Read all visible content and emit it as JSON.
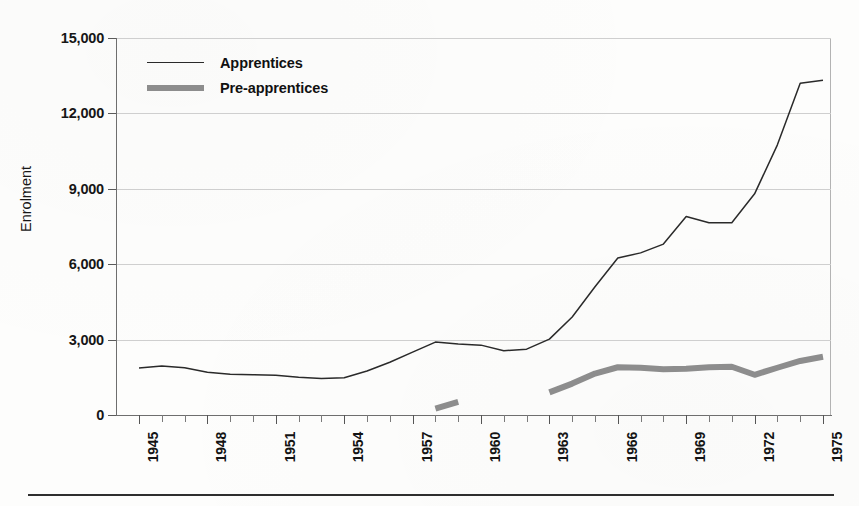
{
  "figure": {
    "ylabel": "Enrolment",
    "legend": [
      {
        "label": "Apprentices",
        "style": "thin-black-line",
        "color": "#2a2a2a"
      },
      {
        "label": "Pre-apprentices",
        "style": "thick-gray-line",
        "color": "#8d8d8d"
      }
    ]
  },
  "axes": {
    "y_ticks": [
      "0",
      "3,000",
      "6,000",
      "9,000",
      "12,000",
      "15,000"
    ],
    "x_ticks": [
      "1945",
      "1948",
      "1951",
      "1954",
      "1957",
      "1960",
      "1963",
      "1966",
      "1969",
      "1972",
      "1975"
    ]
  },
  "chart_data": {
    "type": "line",
    "title": "",
    "xlabel": "",
    "ylabel": "Enrolment",
    "xlim": [
      1945,
      1975
    ],
    "ylim": [
      0,
      15000
    ],
    "yticks": [
      0,
      3000,
      6000,
      9000,
      12000,
      15000
    ],
    "xticks": [
      1945,
      1948,
      1951,
      1954,
      1957,
      1960,
      1963,
      1966,
      1969,
      1972,
      1975
    ],
    "xtick_rotation": 90,
    "grid": "horizontal",
    "legend_position": "upper-left-inside",
    "x": [
      1945,
      1946,
      1947,
      1948,
      1949,
      1950,
      1951,
      1952,
      1953,
      1954,
      1955,
      1956,
      1957,
      1958,
      1959,
      1960,
      1961,
      1962,
      1963,
      1964,
      1965,
      1966,
      1967,
      1968,
      1969,
      1970,
      1971,
      1972,
      1973,
      1974,
      1975
    ],
    "series": [
      {
        "name": "Apprentices",
        "color": "#2a2a2a",
        "line_width": 1.5,
        "values": [
          1870,
          1950,
          1880,
          1700,
          1620,
          1600,
          1580,
          1500,
          1450,
          1480,
          1750,
          2100,
          2500,
          2900,
          2820,
          2780,
          2560,
          2620,
          3020,
          3900,
          5100,
          6250,
          6450,
          6800,
          7900,
          7650,
          7650,
          8800,
          10750,
          13200,
          13320
        ]
      },
      {
        "name": "Pre-apprentices",
        "color": "#8d8d8d",
        "line_width": 6,
        "segments": [
          {
            "x": [
              1958,
              1959
            ],
            "values": [
              250,
              520
            ]
          },
          {
            "x": [
              1963,
              1964,
              1965,
              1966,
              1967,
              1968,
              1969,
              1970,
              1971,
              1972,
              1973,
              1974,
              1975
            ],
            "values": [
              900,
              1250,
              1650,
              1900,
              1880,
              1820,
              1840,
              1900,
              1920,
              1600,
              1880,
              2150,
              2320
            ]
          }
        ]
      }
    ]
  }
}
